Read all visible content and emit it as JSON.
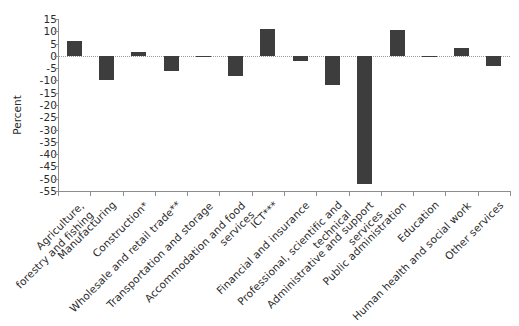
{
  "chart_data": {
    "type": "bar",
    "title": "",
    "xlabel": "",
    "ylabel": "Percent",
    "ylim": [
      -55,
      15
    ],
    "ytick_step": 5,
    "grid": false,
    "legend": null,
    "zero_line": true,
    "bar_color": "#3d3d3d",
    "axis_color": "#8d8d8d",
    "categories": [
      "Agriculture,\nforestry and fishing",
      "Manufacturing",
      "Construction*",
      "Wholesale and retail trade**",
      "Transportation and storage",
      "Accommodation and food\nservices",
      "ICT***",
      "Financial and insurance",
      "Professional, scientific and\ntechnical",
      "Administrative and support\nservices",
      "Public administration",
      "Education",
      "Human health and social work",
      "Other services"
    ],
    "values": [
      6,
      -10,
      1.5,
      -6,
      0,
      -8,
      11,
      -2,
      -12,
      -52,
      10.5,
      -0.5,
      3,
      -4
    ],
    "yticks": [
      15,
      10,
      5,
      0,
      -5,
      -10,
      -15,
      -20,
      -25,
      -30,
      -35,
      -40,
      -45,
      -50,
      -55
    ],
    "ytick_labels": [
      "15",
      "10",
      "5",
      "0",
      "-5",
      "-10",
      "-15",
      "-20",
      "-25",
      "-30",
      "-35",
      "-40",
      "-45",
      "-50",
      "-55"
    ]
  },
  "axis": {
    "y_title": "Percent"
  },
  "xlabels": [
    {
      "line1": "Agriculture,",
      "line2": "forestry and fishing"
    },
    {
      "line1": "Manufacturing",
      "line2": ""
    },
    {
      "line1": "Construction*",
      "line2": ""
    },
    {
      "line1": "Wholesale and retail trade**",
      "line2": ""
    },
    {
      "line1": "Transportation and storage",
      "line2": ""
    },
    {
      "line1": "Accommodation and food",
      "line2": "services"
    },
    {
      "line1": "ICT***",
      "line2": ""
    },
    {
      "line1": "Financial and insurance",
      "line2": ""
    },
    {
      "line1": "Professional, scientific and",
      "line2": "technical"
    },
    {
      "line1": "Administrative and support",
      "line2": "services"
    },
    {
      "line1": "Public administration",
      "line2": ""
    },
    {
      "line1": "Education",
      "line2": ""
    },
    {
      "line1": "Human health and social work",
      "line2": ""
    },
    {
      "line1": "Other services",
      "line2": ""
    }
  ]
}
